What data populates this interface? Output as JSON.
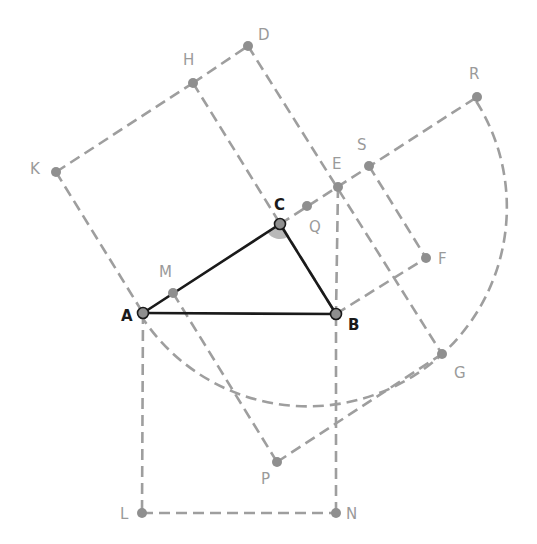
{
  "diagram": {
    "colors": {
      "main": "#1a1a1a",
      "auxiliary": "#9e9e9e",
      "angle_fill": "#b8b8b8"
    },
    "main_points": [
      "A",
      "B",
      "C"
    ],
    "auxiliary_points": [
      "D",
      "E",
      "F",
      "G",
      "H",
      "K",
      "L",
      "M",
      "N",
      "P",
      "Q",
      "R",
      "S"
    ],
    "angle_marker_at": "C",
    "labels": {
      "A": "A",
      "B": "B",
      "C": "C",
      "D": "D",
      "E": "E",
      "F": "F",
      "G": "G",
      "H": "H",
      "K": "K",
      "L": "L",
      "M": "M",
      "N": "N",
      "P": "P",
      "Q": "Q",
      "R": "R",
      "S": "S"
    },
    "solid_segments": [
      [
        "A",
        "B"
      ],
      [
        "B",
        "C"
      ],
      [
        "C",
        "A"
      ]
    ],
    "dashed_segments": [
      [
        "K",
        "H"
      ],
      [
        "H",
        "D"
      ],
      [
        "D",
        "G"
      ],
      [
        "K",
        "A"
      ],
      [
        "H",
        "B"
      ],
      [
        "C",
        "R"
      ],
      [
        "B",
        "F"
      ],
      [
        "S",
        "F"
      ],
      [
        "E",
        "B"
      ],
      [
        "A",
        "L"
      ],
      [
        "L",
        "N"
      ],
      [
        "N",
        "B"
      ],
      [
        "M",
        "P"
      ],
      [
        "P",
        "G"
      ]
    ],
    "dashed_arc": {
      "from": "A",
      "through": "G",
      "to": "R",
      "center": "Q"
    }
  }
}
